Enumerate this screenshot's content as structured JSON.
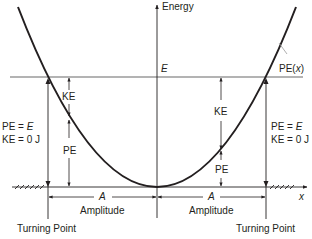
{
  "diagram": {
    "y_axis_label": "Energy",
    "x_axis_label": "x",
    "total_energy_label": "E",
    "curve_label_prefix": "PE(",
    "curve_label_var": "x",
    "curve_label_suffix": ")",
    "left_annotation": {
      "line1_prefix": "PE = ",
      "line1_var": "E",
      "line2": "KE = 0 J"
    },
    "right_annotation": {
      "line1_prefix": "PE = ",
      "line1_var": "E",
      "line2": "KE = 0 J"
    },
    "left_ke_label": "KE",
    "left_pe_label": "PE",
    "right_ke_label": "KE",
    "right_pe_label": "PE",
    "left_amplitude_symbol": "A",
    "left_amplitude_label": "Amplitude",
    "right_amplitude_symbol": "A",
    "right_amplitude_label": "Amplitude",
    "left_turning_point_label": "Turning Point",
    "right_turning_point_label": "Turning Point",
    "colors": {
      "curve": "#231f20",
      "energy_line": "#9a9a9a",
      "axis": "#231f20"
    }
  }
}
